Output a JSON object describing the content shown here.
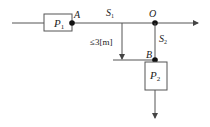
{
  "diagram": {
    "type": "pipe-flow schematic",
    "colors": {
      "line": "#444444",
      "node": "#111111",
      "box_fill": "#ffffff",
      "text": "#222222"
    },
    "nodes": {
      "A": {
        "label": "A"
      },
      "O": {
        "label": "O"
      },
      "B": {
        "label": "B"
      }
    },
    "components": {
      "P1": {
        "label_main": "P",
        "label_sub": "1"
      },
      "P2": {
        "label_main": "P",
        "label_sub": "2"
      }
    },
    "segments": {
      "S1": {
        "label_main": "S",
        "label_sub": "1"
      },
      "S2": {
        "label_main": "S",
        "label_sub": "2"
      }
    },
    "dimension": {
      "label": "≤3[m]"
    }
  }
}
